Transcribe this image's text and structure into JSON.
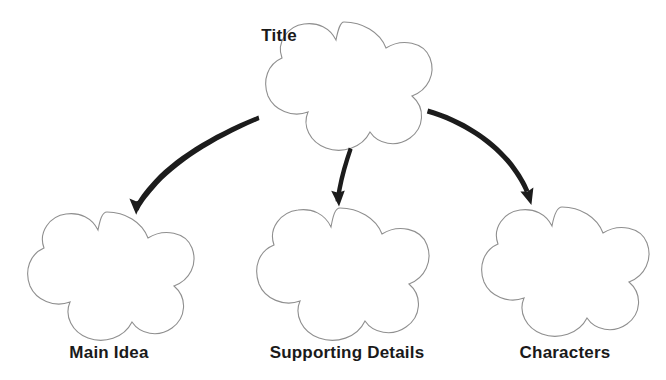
{
  "page": {
    "background_color": "#ffffff",
    "width": 666,
    "height": 380
  },
  "style": {
    "shape_outline_color": "#8f8f8f",
    "shape_fill_color": "#ffffff",
    "shape_outline_width": 1.1,
    "arrow_color": "#1c1c1c",
    "label_color": "#1a1a1a"
  },
  "nodes": [
    {
      "id": "title",
      "label": "Title",
      "shape": "cloud-five-lobe",
      "center_x": 344,
      "center_y": 87,
      "radius_x": 88,
      "radius_y": 65,
      "label_x": 279,
      "label_y": 27,
      "label_position": "upper-left"
    },
    {
      "id": "main-idea",
      "label": "Main Idea",
      "shape": "cloud-five-lobe",
      "center_x": 107,
      "center_y": 275,
      "radius_x": 87,
      "radius_y": 63,
      "label_x": 109,
      "label_y": 344,
      "label_position": "below"
    },
    {
      "id": "supporting-details",
      "label": "Supporting Details",
      "shape": "cloud-five-lobe",
      "center_x": 340,
      "center_y": 273,
      "radius_x": 90,
      "radius_y": 65,
      "label_x": 347,
      "label_y": 344,
      "label_position": "below"
    },
    {
      "id": "characters",
      "label": "Characters",
      "shape": "cloud-five-lobe",
      "center_x": 562,
      "center_y": 271,
      "radius_x": 89,
      "radius_y": 64,
      "label_x": 565,
      "label_y": 344,
      "label_position": "below"
    }
  ],
  "connectors": [
    {
      "id": "title-to-main-idea",
      "from": "title",
      "to": "main-idea",
      "direction": "down-left",
      "start_x": 259,
      "start_y": 121,
      "end_x": 136,
      "end_y": 210,
      "arrowhead": "solid-triangle"
    },
    {
      "id": "title-to-supporting-details",
      "from": "title",
      "to": "supporting-details",
      "direction": "down",
      "start_x": 352,
      "start_y": 150,
      "end_x": 339,
      "end_y": 202,
      "arrowhead": "solid-triangle"
    },
    {
      "id": "title-to-characters",
      "from": "title",
      "to": "characters",
      "direction": "down-right",
      "start_x": 428,
      "start_y": 109,
      "end_x": 530,
      "end_y": 202,
      "arrowhead": "solid-triangle"
    }
  ]
}
